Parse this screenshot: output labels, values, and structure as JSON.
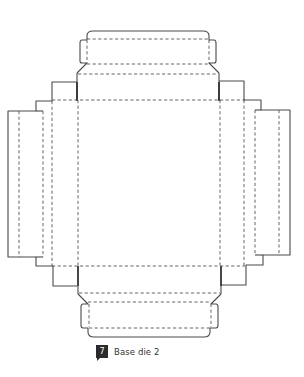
{
  "figure": {
    "caption": {
      "number": "7",
      "title": "Base die 2"
    },
    "legend": {
      "cut_line": "solid",
      "fold_line": "dashed"
    },
    "colors": {
      "line": "#4a4a4a",
      "badge_bg": "#2b2b2b",
      "badge_text": "#ffffff",
      "caption_text": "#333333"
    },
    "parts": [
      "top-tuck-tab",
      "top-flap",
      "main-base-panel",
      "left-side-flaps",
      "right-side-flaps",
      "bottom-flap",
      "bottom-tuck-tab"
    ]
  }
}
